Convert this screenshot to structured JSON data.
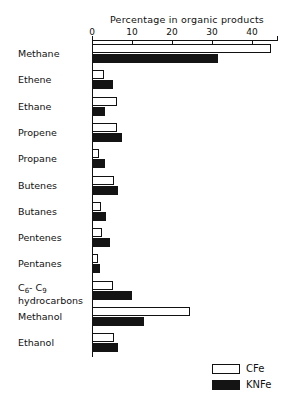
{
  "chart_data": {
    "type": "bar",
    "orientation": "horizontal",
    "title": "",
    "xlabel": "Percentage in organic products",
    "ylabel": "",
    "xlim": [
      0,
      46
    ],
    "xticks": [
      0,
      10,
      20,
      30,
      40
    ],
    "xticklabels": [
      "0",
      "10",
      "20",
      "30",
      "40"
    ],
    "grid": false,
    "legend_position": "bottom-right",
    "categories": [
      "Methane",
      "Ethene",
      "Ethane",
      "Propene",
      "Propane",
      "Butenes",
      "Butanes",
      "Pentenes",
      "Pentanes",
      "C6-C9 hydrocarbons",
      "Methanol",
      "Ethanol"
    ],
    "category_labels_html": [
      "Methane",
      "Ethene",
      "Ethane",
      "Propene",
      "Propane",
      "Butenes",
      "Butanes",
      "Pentenes",
      "Pentanes",
      "C<sub>6</sub>- C<sub>9</sub><br>hydrocarbons",
      "Methanol",
      "Ethanol"
    ],
    "series": [
      {
        "name": "CFe",
        "color": "#ffffff",
        "edgecolor": "#111111",
        "values": [
          44.8,
          3.0,
          6.2,
          6.2,
          1.8,
          5.5,
          2.2,
          2.5,
          1.5,
          5.2,
          24.5,
          5.5
        ]
      },
      {
        "name": "KNFe",
        "color": "#141414",
        "edgecolor": "#141414",
        "values": [
          31.5,
          5.2,
          3.2,
          7.5,
          3.2,
          6.5,
          3.5,
          4.5,
          2.0,
          10.0,
          13.0,
          6.5
        ]
      }
    ]
  },
  "legend": {
    "items": [
      {
        "label": "CFe",
        "swatch": "open"
      },
      {
        "label": "KNFe",
        "swatch": "filled"
      }
    ]
  }
}
